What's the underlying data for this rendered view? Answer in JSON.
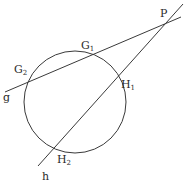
{
  "diagram": {
    "title": "",
    "circle": {
      "cx": 75,
      "cy": 102,
      "r": 51
    },
    "lines": [
      {
        "name": "g",
        "x1": 5,
        "y1": 92,
        "x2": 181,
        "y2": 17
      },
      {
        "name": "h",
        "x1": 183,
        "y1": 4,
        "x2": 38,
        "y2": 166
      }
    ],
    "labels": {
      "P": {
        "base": "P",
        "sub": ""
      },
      "G1": {
        "base": "G",
        "sub": "1"
      },
      "G2": {
        "base": "G",
        "sub": "2"
      },
      "H1": {
        "base": "H",
        "sub": "1"
      },
      "H2": {
        "base": "H",
        "sub": "2"
      },
      "g": {
        "base": "g",
        "sub": ""
      },
      "h": {
        "base": "h",
        "sub": ""
      }
    },
    "colors": {
      "stroke": "#3a3a3a",
      "text": "#2a2a2a",
      "background": "#ffffff"
    }
  }
}
